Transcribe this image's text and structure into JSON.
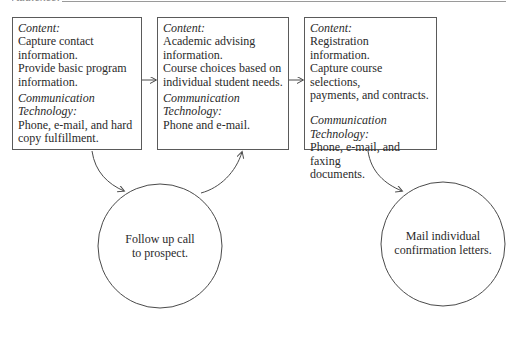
{
  "header": {
    "cropped_heading": "Audience:",
    "rule": true
  },
  "boxes": [
    {
      "content_label": "Content:",
      "content_text": "Capture contact\ninformation.\nProvide basic program\ninformation.",
      "tech_label": "Communication Technology:",
      "tech_text": "Phone, e-mail, and hard\ncopy fulfillment."
    },
    {
      "content_label": "Content:",
      "content_text": "Academic advising\ninformation.\nCourse choices based on\nindividual student needs.",
      "tech_label": "Communication Technology:",
      "tech_text": "Phone and e-mail."
    },
    {
      "content_label": "Content:",
      "content_text": "Registration information.\nCapture course selections,\npayments, and contracts.",
      "tech_label": "Communication Technology:",
      "tech_text": "Phone, e-mail, and faxing\ndocuments."
    }
  ],
  "circles": [
    {
      "text": "Follow up call\nto prospect."
    },
    {
      "text": "Mail individual\nconfirmation letters."
    }
  ],
  "colors": {
    "line": "#4a4a4a",
    "text": "#2a2a2a",
    "rule": "#9a9a9a"
  }
}
